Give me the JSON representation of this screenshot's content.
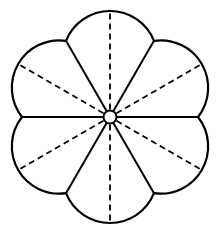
{
  "diagram": {
    "title": "",
    "shape": "six-petal flower",
    "petal_count": 6,
    "center": [
      110,
      117
    ],
    "junction_radius": 88,
    "petal_tip_radius": 106,
    "hub_radius": 6.5,
    "solid_divider_angles_deg": [
      0,
      60,
      120,
      180,
      240,
      300
    ],
    "dashed_midline_angles_deg": [
      30,
      90,
      150,
      210,
      270,
      330
    ],
    "stroke_color": "#000000",
    "fill_color": "#ffffff"
  }
}
